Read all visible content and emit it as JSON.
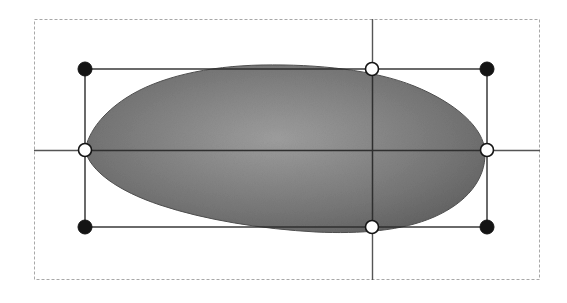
{
  "document": {
    "title": "Shape Selection Canvas",
    "description": "Vector editing canvas showing a selected gradient-filled blob shape with selection bounding box, eight resize handles and crosshair guide lines."
  },
  "canvas": {
    "width": 567,
    "height": 303,
    "background_color": "#ffffff"
  },
  "artboard_frame": {
    "label": "Artboard Frame",
    "x": 34,
    "y": 19,
    "width": 506,
    "height": 261,
    "stroke_color": "#a8a8a8",
    "stroke_style": "dashed",
    "stroke_width": 1,
    "fill": "none"
  },
  "shape": {
    "label": "Gradient Blob Shape",
    "type": "closed-bezier-path",
    "fill_type": "radial-gradient",
    "gradient_center_color": "#9a9a9a",
    "gradient_mid_color": "#7e7e7e",
    "gradient_edge_color": "#656565",
    "gradient_center_x_pct": 48,
    "gradient_center_y_pct": 44,
    "outline_color": "#4a4a4a",
    "outline_width": 1,
    "path": "M 85 150 C 96 119 130 92 182 78 C 236 64 312 62 370 69 C 430 76 480 100 484 140 C 488 183 448 215 390 226 C 330 237 250 233 190 216 C 135 200 95 176 85 150 Z"
  },
  "selection_box": {
    "label": "Selection Bounding Box",
    "left": 85,
    "top": 69,
    "right": 487,
    "bottom": 227,
    "width": 402,
    "height": 158,
    "center_x": 372,
    "center_y": 150,
    "stroke_color": "#2b2b2b",
    "stroke_width": 1
  },
  "guides": {
    "label": "Crosshair Guide Lines",
    "stroke_color": "#555555",
    "stroke_width": 1,
    "horizontal": {
      "name": "horizontal-guide",
      "y": 150,
      "x_start": 34,
      "x_end": 540
    },
    "vertical": {
      "name": "vertical-guide",
      "x": 372,
      "y_start": 19,
      "y_end": 280
    }
  },
  "handles": {
    "label": "Resize Handles",
    "corner_fill": "#141414",
    "corner_stroke": "#141414",
    "edge_fill": "#ffffff",
    "edge_stroke": "#141414",
    "corner_radius": 7,
    "edge_radius": 6.5,
    "items": [
      {
        "name": "handle-top-left",
        "role": "corner",
        "cursor": "nwse-resize",
        "x": 85,
        "y": 69,
        "style": "filled-black"
      },
      {
        "name": "handle-top-center",
        "role": "edge",
        "cursor": "ns-resize",
        "x": 372,
        "y": 69,
        "style": "hollow-white"
      },
      {
        "name": "handle-top-right",
        "role": "corner",
        "cursor": "nesw-resize",
        "x": 487,
        "y": 69,
        "style": "filled-black"
      },
      {
        "name": "handle-middle-left",
        "role": "edge",
        "cursor": "ew-resize",
        "x": 85,
        "y": 150,
        "style": "hollow-white"
      },
      {
        "name": "handle-middle-right",
        "role": "edge",
        "cursor": "ew-resize",
        "x": 487,
        "y": 150,
        "style": "hollow-white"
      },
      {
        "name": "handle-bottom-left",
        "role": "corner",
        "cursor": "nesw-resize",
        "x": 85,
        "y": 227,
        "style": "filled-black"
      },
      {
        "name": "handle-bottom-center",
        "role": "edge",
        "cursor": "ns-resize",
        "x": 372,
        "y": 227,
        "style": "hollow-white"
      },
      {
        "name": "handle-bottom-right",
        "role": "corner",
        "cursor": "nwse-resize",
        "x": 487,
        "y": 227,
        "style": "filled-black"
      }
    ]
  }
}
